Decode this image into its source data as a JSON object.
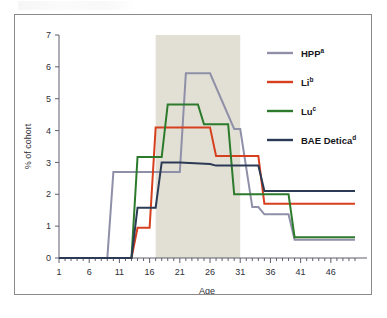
{
  "figure": {
    "frame_border_color": "#8a8a8a",
    "background_color": "#ffffff"
  },
  "chart_data": {
    "type": "line",
    "title": "",
    "xlabel": "Age",
    "ylabel": "% of cohort",
    "xlim": [
      1,
      50
    ],
    "ylim": [
      0,
      7
    ],
    "grid": false,
    "legend_position": "top-right",
    "x_ticks": [
      1,
      6,
      11,
      16,
      21,
      26,
      31,
      36,
      41,
      46
    ],
    "x_minor_tick_step": 1,
    "y_ticks": [
      0,
      1,
      2,
      3,
      4,
      5,
      6,
      7
    ],
    "shaded_band": {
      "label": "",
      "x_start": 17,
      "x_end": 31,
      "color": "#e2e0d4"
    },
    "series": [
      {
        "name": "HPP",
        "superscript": "a",
        "color": "#8f8fa8",
        "x": [
          1,
          6,
          9,
          10,
          17,
          18,
          21,
          22,
          25,
          26,
          30,
          31,
          33,
          34,
          35,
          39,
          40,
          44,
          50
        ],
        "values": [
          0,
          0,
          0,
          2.7,
          2.7,
          2.7,
          2.7,
          5.8,
          5.8,
          5.8,
          4.05,
          4.05,
          1.6,
          1.6,
          1.37,
          1.37,
          0.57,
          0.57,
          0.57
        ]
      },
      {
        "name": "Li",
        "superscript": "b",
        "color": "#d6401e",
        "x": [
          1,
          6,
          11,
          13,
          14,
          16,
          17,
          21,
          26,
          27,
          31,
          34,
          35,
          36,
          41,
          46,
          50
        ],
        "values": [
          0,
          0,
          0,
          0,
          0.95,
          0.95,
          4.1,
          4.1,
          4.1,
          3.2,
          3.2,
          3.2,
          1.7,
          1.7,
          1.7,
          1.7,
          1.7
        ]
      },
      {
        "name": "Lu",
        "superscript": "c",
        "color": "#2c7a2c",
        "x": [
          1,
          6,
          11,
          13,
          14,
          16,
          18,
          19,
          24,
          25,
          26,
          29,
          30,
          31,
          36,
          39,
          40,
          45,
          50
        ],
        "values": [
          0,
          0,
          0,
          0,
          3.17,
          3.17,
          3.17,
          4.82,
          4.82,
          4.2,
          4.2,
          4.2,
          2.0,
          2.0,
          2.0,
          2.0,
          0.65,
          0.65,
          0.65
        ]
      },
      {
        "name": "BAE Detica",
        "superscript": "d",
        "color": "#2b3a55",
        "x": [
          1,
          6,
          11,
          13,
          14,
          17,
          18,
          21,
          26,
          27,
          31,
          34,
          35,
          36,
          41,
          46,
          50
        ],
        "values": [
          0,
          0,
          0,
          0,
          1.58,
          1.58,
          3.0,
          3.0,
          2.95,
          2.9,
          2.9,
          2.9,
          2.1,
          2.1,
          2.1,
          2.1,
          2.1
        ]
      }
    ]
  },
  "legend": {
    "entries": [
      {
        "label": "HPP",
        "superscript": "a",
        "color": "#8f8fa8"
      },
      {
        "label": "Li",
        "superscript": "b",
        "color": "#d6401e"
      },
      {
        "label": "Lu",
        "superscript": "c",
        "color": "#2c7a2c"
      },
      {
        "label": "BAE Detica",
        "superscript": "d",
        "color": "#2b3a55"
      }
    ]
  }
}
